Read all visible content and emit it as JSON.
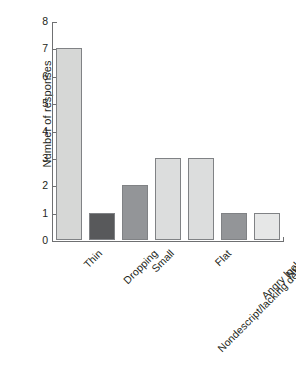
{
  "chart_data": {
    "type": "bar",
    "title": "",
    "xlabel": "",
    "ylabel": "Number of responses",
    "categories": [
      "Thin",
      "Dropping",
      "Small",
      "Nondescript/lacking definition",
      "Flat",
      "Angry looking",
      "Normal"
    ],
    "values": [
      7,
      1,
      2,
      3,
      3,
      1,
      1
    ],
    "bar_colors": [
      "#d6d7d6",
      "#58595b",
      "#939598",
      "#dcdddd",
      "#dcdddd",
      "#939598",
      "#e6e7e7"
    ],
    "bar_edge_color": "#808285",
    "ylim": [
      0,
      8
    ],
    "yticks": [
      0,
      1,
      2,
      3,
      4,
      5,
      6,
      7,
      8
    ],
    "ytick_labels": [
      "0",
      "1",
      "2",
      "3",
      "4",
      "5",
      "6",
      "7",
      "8"
    ],
    "grid": false,
    "legend": null,
    "xtick_label_rotation": 45,
    "axis_color": "#6f7072",
    "text_color": "#231f20",
    "background": "#ffffff"
  }
}
